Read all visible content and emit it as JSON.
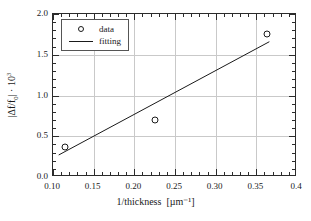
{
  "chart_data": {
    "type": "scatter",
    "title": "",
    "xlabel": "1/thickness",
    "xunit": "[µm⁻¹]",
    "ylabel_parts": {
      "prefix": "|Δf/f",
      "sub": "0",
      "mid": "| · 10",
      "sup": "3"
    },
    "ylabel_plain": "|Δf/f0| · 10^3",
    "xlim": [
      0.1,
      0.4
    ],
    "ylim": [
      0.0,
      2.0
    ],
    "xticks": [
      0.1,
      0.15,
      0.2,
      0.25,
      0.3,
      0.35,
      0.4
    ],
    "xtick_labels": [
      "0.10",
      "0.15",
      "0.20",
      "0.25",
      "0.30",
      "0.35",
      "0.4"
    ],
    "yticks": [
      0.0,
      0.5,
      1.0,
      1.5,
      2.0
    ],
    "ytick_labels": [
      "0.0",
      "0.5",
      "1.0",
      "1.5",
      "2.0"
    ],
    "x_minor_step": 0.01,
    "y_minor_step": 0.1,
    "grid": true,
    "grid_color": "#c9c9c9",
    "axis_color": "#2b2b2b",
    "series": [
      {
        "name": "data",
        "type": "scatter",
        "marker": "open-circle",
        "color": "#1a1a1a",
        "x": [
          0.115,
          0.225,
          0.363
        ],
        "y": [
          0.37,
          0.7,
          1.75
        ]
      },
      {
        "name": "fitting",
        "type": "line",
        "color": "#1a1a1a",
        "x": [
          0.107,
          0.366
        ],
        "y": [
          0.27,
          1.66
        ]
      }
    ],
    "legend": {
      "position": "upper-left",
      "entries": [
        {
          "label": "data",
          "key": "open-circle"
        },
        {
          "label": "fitting",
          "key": "line"
        }
      ]
    }
  }
}
